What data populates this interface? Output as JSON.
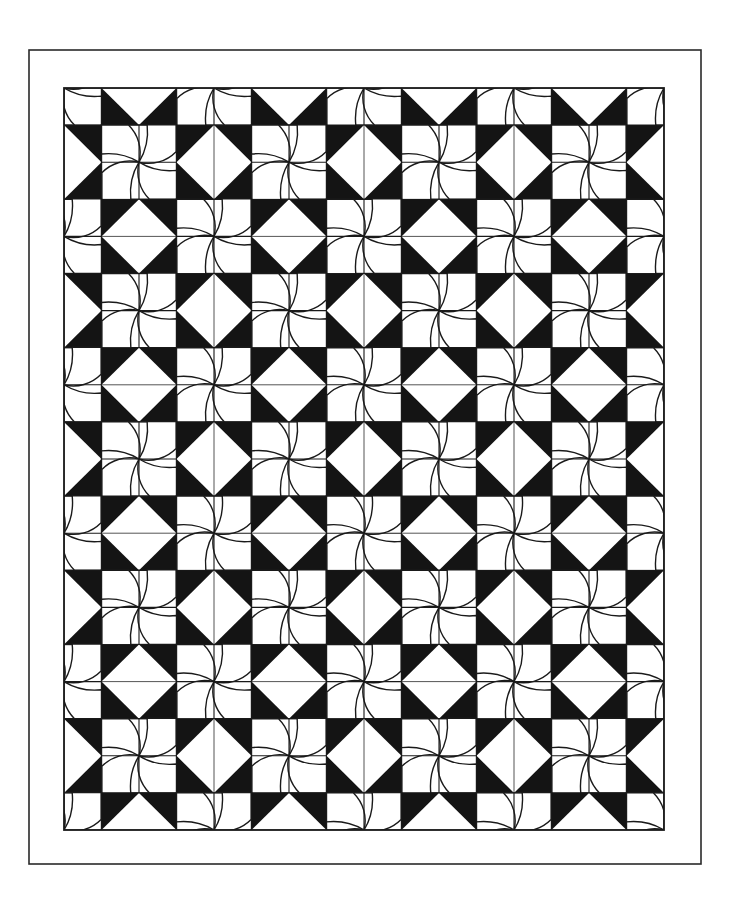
{
  "canvas": {
    "width": 729,
    "height": 904,
    "background": "#ffffff"
  },
  "outer_border": {
    "x": 29,
    "y": 50,
    "width": 672,
    "height": 814,
    "stroke": "#2a2a2a",
    "stroke_width": 1.6
  },
  "grid": {
    "x": 64,
    "y": 88,
    "width": 600,
    "height": 742,
    "cols": 16,
    "rows": 20,
    "block_cols": 8,
    "block_rows": 10,
    "note_offset": "half-block offset on all four edges",
    "stroke": "#1a1a1a",
    "stroke_width": 1.4
  },
  "colors": {
    "black_fill": "#141414",
    "white_fill": "#ffffff",
    "stipple_dot": "#222222",
    "line": "#1a1a1a"
  },
  "blocks": {
    "pinwheel": {
      "name": "curved pinwheel",
      "rule": "(bx+by) even",
      "blades": 4,
      "fill": "stippled"
    },
    "hourglass": {
      "name": "square-in-square hourglass",
      "rule": "(bx+by) odd",
      "vertical_split_when": "bx odd",
      "horizontal_split_when": "bx even"
    }
  }
}
